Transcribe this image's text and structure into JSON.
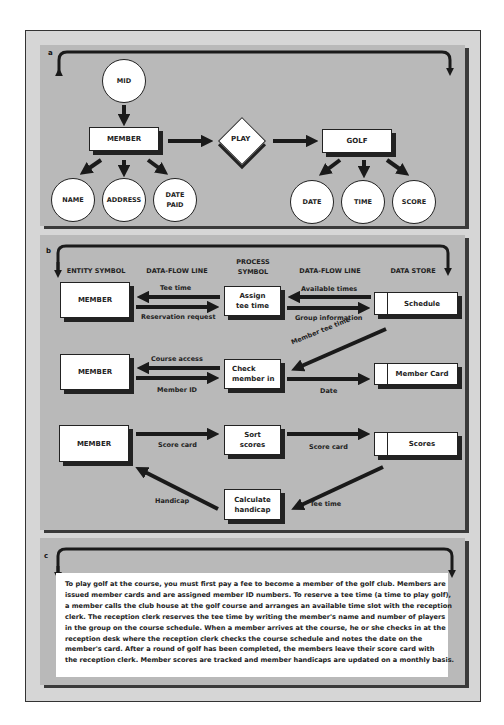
{
  "panel_a": {
    "label": "a",
    "entities": {
      "member": "MEMBER",
      "golf": "GOLF"
    },
    "relationship": "PLAY",
    "attributes": {
      "mid": "MID",
      "name": "NAME",
      "address": "ADDRESS",
      "date_paid_line1": "DATE",
      "date_paid_line2": "PAID",
      "date": "DATE",
      "time": "TIME",
      "score": "SCORE"
    }
  },
  "panel_b": {
    "label": "b",
    "headers": {
      "entity_symbol": "ENTITY SYMBOL",
      "data_flow_line_left": "DATA-FLOW LINE",
      "process_symbol_line1": "PROCESS",
      "process_symbol_line2": "SYMBOL",
      "data_flow_line_right": "DATA-FLOW LINE",
      "data_store": "DATA STORE"
    },
    "rows": [
      {
        "entity": "MEMBER",
        "process_line1": "Assign",
        "process_line2": "tee time",
        "store": "Schedule",
        "flow_left_top": "Tee time",
        "flow_left_bottom": "Reservation request",
        "flow_right_top": "Available times",
        "flow_right_bottom": "Group information"
      },
      {
        "entity": "MEMBER",
        "process_line1": "Check",
        "process_line2": "member in",
        "store": "Member Card",
        "flow_left_top": "Course access",
        "flow_left_bottom": "Member ID",
        "flow_right_bottom": "Date",
        "flow_diagonal": "Member tee time"
      },
      {
        "entity": "MEMBER",
        "process_line1": "Sort",
        "process_line2": "scores",
        "store": "Scores",
        "flow_left_bottom": "Score card",
        "flow_right_bottom": "Score card"
      }
    ],
    "calc": {
      "process_line1": "Calculate",
      "process_line2": "handicap",
      "flow_left": "Handicap",
      "flow_right": "Tee time"
    }
  },
  "panel_c": {
    "label": "c",
    "lines": [
      "To play golf at the course, you must first pay a fee to become a member of the golf club. Members are",
      "issued member cards and are assigned member ID numbers. To reserve a tee time (a time to play golf),",
      "a member calls the club house at the golf course and arranges an available time slot with the reception",
      "clerk. The reception clerk reserves the tee time by writing the member's name and number of players",
      "in the group on the course schedule. When a member arrives at the course, he or she checks in at the",
      "reception desk where the reception clerk checks the course schedule and notes the date on the",
      "member's card. After a round of golf has been completed, the members leave their score card with",
      "the reception clerk. Member scores are tracked and member handicaps are updated on a monthly basis."
    ]
  },
  "colors": {
    "frame_bg": "#d6d6d6",
    "panel_bg": "#b9b9b9",
    "shadow": "#3a3a3a",
    "ink": "#222222"
  }
}
